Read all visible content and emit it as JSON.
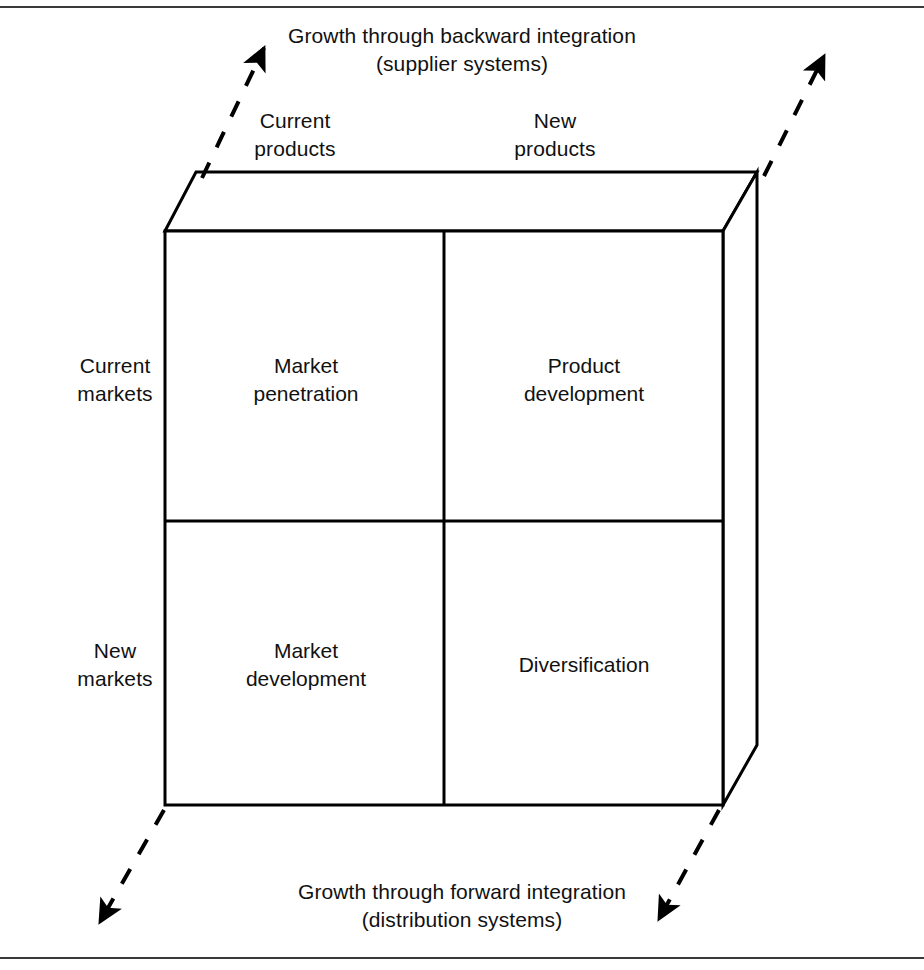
{
  "axes": {
    "top": {
      "line1": "Growth through backward integration",
      "line2": "(supplier systems)",
      "text": "Growth through backward integration\n(supplier systems)"
    },
    "bottom": {
      "line1": "Growth through forward integration",
      "line2": "(distribution systems)",
      "text": "Growth through forward integration\n(distribution systems)"
    }
  },
  "column_headers": [
    {
      "id": "current-products",
      "line1": "Current",
      "line2": "products",
      "text": "Current\nproducts"
    },
    {
      "id": "new-products",
      "line1": "New",
      "line2": "products",
      "text": "New\nproducts"
    }
  ],
  "row_headers": [
    {
      "id": "current-markets",
      "line1": "Current",
      "line2": "markets",
      "text": "Current\nmarkets"
    },
    {
      "id": "new-markets",
      "line1": "New",
      "line2": "markets",
      "text": "New\nmarkets"
    }
  ],
  "cells": [
    {
      "id": "market-penetration",
      "row": "current-markets",
      "column": "current-products",
      "text": "Market\npenetration"
    },
    {
      "id": "product-development",
      "row": "current-markets",
      "column": "new-products",
      "text": "Product\ndevelopment"
    },
    {
      "id": "market-development",
      "row": "new-markets",
      "column": "current-products",
      "text": "Market\ndevelopment"
    },
    {
      "id": "diversification",
      "row": "new-markets",
      "column": "new-products",
      "text": "Diversification"
    }
  ],
  "arrows": [
    {
      "id": "top-left-arrow",
      "direction": "up-right",
      "style": "dashed",
      "points_to": "backward-integration"
    },
    {
      "id": "top-right-arrow",
      "direction": "up-right",
      "style": "dashed",
      "points_to": "backward-integration"
    },
    {
      "id": "bottom-left-arrow",
      "direction": "down-left",
      "style": "dashed",
      "points_to": "forward-integration"
    },
    {
      "id": "bottom-right-arrow",
      "direction": "down-left",
      "style": "dashed",
      "points_to": "forward-integration"
    }
  ],
  "colors": {
    "ink": "#000000",
    "rule": "#3a3a3a",
    "background": "#ffffff"
  }
}
